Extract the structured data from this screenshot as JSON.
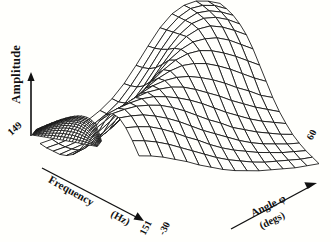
{
  "figure": {
    "background_color": "#fffffc",
    "ink_color": "#111111"
  },
  "axes": {
    "amplitude": {
      "label": "Amplitude",
      "origin_tick": "149",
      "arrow": "up-arrow-icon"
    },
    "frequency": {
      "label": "Frequency",
      "unit": "(Hz)",
      "start_tick": "149",
      "end_tick": "151",
      "arrow": "down-right-arrow-icon"
    },
    "angle": {
      "label": "Angle φ",
      "unit": "(degs)",
      "start_tick": "-30",
      "end_tick": "60",
      "arrow": "up-right-arrow-icon"
    }
  },
  "chart_data": {
    "type": "surface",
    "title": "",
    "xlabel": "Angle φ (degs)",
    "ylabel": "Frequency (Hz)",
    "zlabel": "Amplitude",
    "xlim": [
      -30,
      60
    ],
    "ylim": [
      149,
      151
    ],
    "zlim": [
      0,
      1
    ],
    "grid": true,
    "legend": false,
    "x_ticks": [
      "-30",
      "60"
    ],
    "y_ticks": [
      "149",
      "151"
    ],
    "x": [
      -30,
      -24,
      -18,
      -12,
      -6,
      0,
      6,
      12,
      18,
      24,
      30,
      36,
      42,
      48,
      54,
      60
    ],
    "y": [
      149.0,
      149.133,
      149.267,
      149.4,
      149.533,
      149.667,
      149.8,
      149.933,
      150.067,
      150.2,
      150.333,
      150.467,
      150.6,
      150.733,
      150.867,
      151.0
    ],
    "z": [
      [
        0.06,
        0.07,
        0.09,
        0.12,
        0.16,
        0.22,
        0.3,
        0.41,
        0.55,
        0.7,
        0.84,
        0.94,
        0.99,
        1.0,
        0.97,
        0.92
      ],
      [
        0.06,
        0.07,
        0.09,
        0.12,
        0.17,
        0.23,
        0.31,
        0.43,
        0.57,
        0.72,
        0.86,
        0.95,
        1.0,
        1.0,
        0.97,
        0.91
      ],
      [
        0.07,
        0.08,
        0.1,
        0.13,
        0.18,
        0.25,
        0.34,
        0.46,
        0.6,
        0.75,
        0.88,
        0.96,
        1.0,
        0.99,
        0.95,
        0.89
      ],
      [
        0.08,
        0.1,
        0.12,
        0.16,
        0.21,
        0.29,
        0.39,
        0.51,
        0.65,
        0.79,
        0.9,
        0.97,
        0.99,
        0.97,
        0.92,
        0.85
      ],
      [
        0.11,
        0.13,
        0.16,
        0.21,
        0.27,
        0.36,
        0.47,
        0.59,
        0.72,
        0.84,
        0.92,
        0.96,
        0.96,
        0.92,
        0.86,
        0.79
      ],
      [
        0.16,
        0.19,
        0.24,
        0.3,
        0.38,
        0.48,
        0.59,
        0.7,
        0.8,
        0.87,
        0.91,
        0.91,
        0.89,
        0.84,
        0.77,
        0.7
      ],
      [
        0.24,
        0.29,
        0.35,
        0.43,
        0.52,
        0.61,
        0.7,
        0.78,
        0.84,
        0.87,
        0.87,
        0.84,
        0.79,
        0.73,
        0.66,
        0.59
      ],
      [
        0.36,
        0.42,
        0.49,
        0.57,
        0.64,
        0.71,
        0.77,
        0.81,
        0.83,
        0.82,
        0.79,
        0.74,
        0.68,
        0.61,
        0.54,
        0.48
      ],
      [
        0.5,
        0.56,
        0.62,
        0.68,
        0.73,
        0.77,
        0.79,
        0.79,
        0.77,
        0.73,
        0.68,
        0.62,
        0.55,
        0.49,
        0.42,
        0.37
      ],
      [
        0.63,
        0.68,
        0.72,
        0.76,
        0.78,
        0.78,
        0.77,
        0.74,
        0.69,
        0.63,
        0.57,
        0.5,
        0.44,
        0.38,
        0.33,
        0.28
      ],
      [
        0.73,
        0.76,
        0.78,
        0.79,
        0.78,
        0.75,
        0.71,
        0.66,
        0.6,
        0.53,
        0.46,
        0.4,
        0.34,
        0.29,
        0.25,
        0.21
      ],
      [
        0.78,
        0.79,
        0.79,
        0.77,
        0.74,
        0.69,
        0.63,
        0.56,
        0.49,
        0.43,
        0.36,
        0.31,
        0.26,
        0.22,
        0.18,
        0.15
      ],
      [
        0.78,
        0.77,
        0.75,
        0.71,
        0.66,
        0.6,
        0.53,
        0.46,
        0.4,
        0.34,
        0.28,
        0.23,
        0.19,
        0.16,
        0.13,
        0.11
      ],
      [
        0.73,
        0.71,
        0.68,
        0.63,
        0.57,
        0.5,
        0.44,
        0.37,
        0.31,
        0.26,
        0.22,
        0.18,
        0.15,
        0.12,
        0.1,
        0.08
      ],
      [
        0.65,
        0.62,
        0.58,
        0.53,
        0.47,
        0.41,
        0.35,
        0.29,
        0.24,
        0.2,
        0.16,
        0.13,
        0.11,
        0.09,
        0.07,
        0.06
      ],
      [
        0.55,
        0.52,
        0.48,
        0.43,
        0.38,
        0.32,
        0.27,
        0.22,
        0.18,
        0.15,
        0.12,
        0.1,
        0.08,
        0.06,
        0.05,
        0.04
      ]
    ],
    "side_lobe": {
      "present": true,
      "description": "dense dark secondary lobe at low frequency / low angle"
    }
  }
}
